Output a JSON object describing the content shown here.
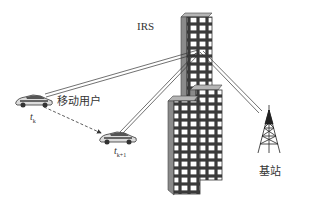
{
  "diagram": {
    "labels": {
      "irs": "IRS",
      "mobile_user": "移动用户",
      "base_station": "基站",
      "time_k": {
        "main": "t",
        "sub": "k"
      },
      "time_k1": {
        "main": "t",
        "sub": "k+1"
      }
    },
    "nodes": [
      {
        "id": "irs",
        "type": "building-with-irs",
        "label": "IRS"
      },
      {
        "id": "user_tk",
        "type": "car",
        "label": "移动用户",
        "time": "t_k"
      },
      {
        "id": "user_tk1",
        "type": "car",
        "time": "t_k+1"
      },
      {
        "id": "bs",
        "type": "cell-tower",
        "label": "基站"
      },
      {
        "id": "building_front",
        "type": "building"
      },
      {
        "id": "building_mid",
        "type": "building"
      }
    ],
    "edges": [
      {
        "from": "user_tk",
        "to": "irs",
        "style": "double-line"
      },
      {
        "from": "user_tk1",
        "to": "irs",
        "style": "double-line"
      },
      {
        "from": "bs",
        "to": "irs",
        "style": "double-line"
      },
      {
        "from": "user_tk",
        "to": "user_tk1",
        "style": "dashed-arrow"
      }
    ],
    "colors": {
      "line": "#333333",
      "building_face": "#ffffff",
      "building_side": "#8a8a8a",
      "building_top": "#b5b5b5"
    }
  }
}
